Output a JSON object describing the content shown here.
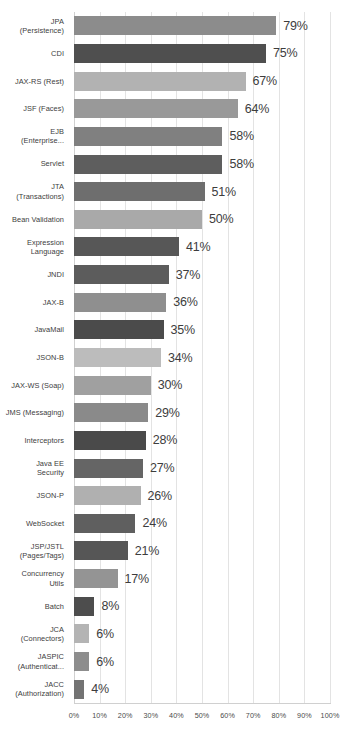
{
  "chart_data": {
    "type": "bar",
    "orientation": "horizontal",
    "title": "",
    "subtitle": "",
    "xlabel": "",
    "ylabel": "",
    "xlim": [
      0,
      100
    ],
    "grid": true,
    "legend": null,
    "value_suffix": "%",
    "xtick_labels": [
      "0%",
      "10%",
      "20%",
      "30%",
      "40%",
      "50%",
      "60%",
      "70%",
      "80%",
      "90%",
      "100%"
    ],
    "xtick_values": [
      0,
      10,
      20,
      30,
      40,
      50,
      60,
      70,
      80,
      90,
      100
    ],
    "categories": [
      "JPA\n(Persistence)",
      "CDI",
      "JAX-RS (Rest)",
      "JSF (Faces)",
      "EJB\n(Enterprise...",
      "Servlet",
      "JTA\n(Transactions)",
      "Bean Validation",
      "Expression\nLanguage",
      "JNDI",
      "JAX-B",
      "JavaMail",
      "JSON-B",
      "JAX-WS (Soap)",
      "JMS (Messaging)",
      "Interceptors",
      "Java EE\nSecurity",
      "JSON-P",
      "WebSocket",
      "JSP/JSTL\n(Pages/Tags)",
      "Concurrency\nUtils",
      "Batch",
      "JCA\n(Connectors)",
      "JASPIC\n(Authenticat...",
      "JACC\n(Authorization)"
    ],
    "values": [
      79,
      75,
      67,
      64,
      58,
      58,
      51,
      50,
      41,
      37,
      36,
      35,
      34,
      30,
      29,
      28,
      27,
      26,
      24,
      21,
      17,
      8,
      6,
      6,
      4
    ],
    "value_labels": [
      "79%",
      "75%",
      "67%",
      "64%",
      "58%",
      "58%",
      "51%",
      "50%",
      "41%",
      "37%",
      "36%",
      "35%",
      "34%",
      "30%",
      "29%",
      "28%",
      "27%",
      "26%",
      "24%",
      "21%",
      "17%",
      "8%",
      "6%",
      "6%",
      "4%"
    ],
    "bar_colors": [
      "#8c8c8c",
      "#4f4f4f",
      "#b2b2b2",
      "#999999",
      "#808080",
      "#5e5e5e",
      "#6e6e6e",
      "#a9a9a9",
      "#575757",
      "#5c5c5c",
      "#8f8f8f",
      "#4b4b4b",
      "#bcbcbc",
      "#a0a0a0",
      "#8a8a8a",
      "#4a4a4a",
      "#656565",
      "#b0b0b0",
      "#5f5f5f",
      "#565656",
      "#949494",
      "#4d4d4d",
      "#b4b4b4",
      "#8d8d8d",
      "#737373"
    ],
    "grid_color": "#e3e3e3",
    "axis_color": "#d0d0d0",
    "text_color": "#3d3d3d",
    "background": "#ffffff"
  }
}
